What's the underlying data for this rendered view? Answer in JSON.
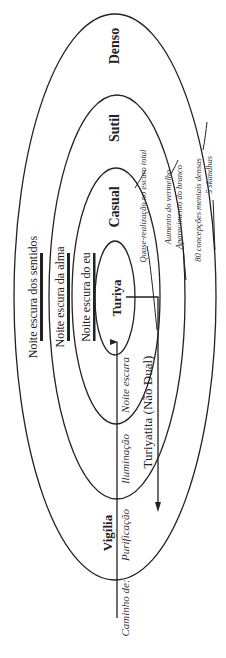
{
  "diagram": {
    "orientation": "rotated-90-ccw",
    "levels": [
      {
        "id": "denso",
        "label": "Denso"
      },
      {
        "id": "sutil",
        "label": "Sutil"
      },
      {
        "id": "casual",
        "label": "Casual"
      },
      {
        "id": "turiya",
        "label": "Turiya"
      }
    ],
    "waking_label": "Vigília",
    "nondual_label": "Turiyatita (Não Dual)",
    "dark_nights": {
      "senses": "Noite escura dos sentidos",
      "soul": "Noite escura da alma",
      "self": "Noite escura do eu"
    },
    "path": {
      "prefix": "Caminho de:",
      "purification": "Purificação",
      "illumination": "Iluminação",
      "dark_night": "Noite escura"
    },
    "annotations": {
      "quasi": "Quase-realização no escuro total",
      "red": "Aumento do vermelho",
      "white": "Aparecimento do branco",
      "eighty": "80 concepções mentais densas",
      "skandhas": "5 skandhas"
    },
    "colors": {
      "line": "#222222",
      "background": "#ffffff"
    }
  }
}
